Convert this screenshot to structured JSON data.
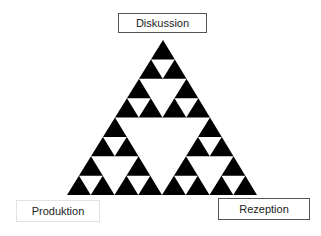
{
  "diagram": {
    "type": "sierpinski-triangle",
    "fill_color": "#000000",
    "hole_color": "#ffffff",
    "levels": 3,
    "labels": {
      "top": "Diskussion",
      "bottom_left": "Produktion",
      "bottom_right": "Rezeption"
    }
  }
}
